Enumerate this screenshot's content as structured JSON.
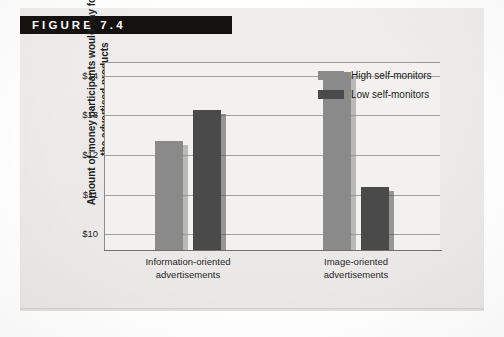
{
  "figure": {
    "header_label": "FIGURE 7.4"
  },
  "chart_data": {
    "type": "bar",
    "title": "",
    "xlabel": "",
    "ylabel": "Amount of money participants would pay for the advertised products",
    "categories": [
      "Information-oriented advertisements",
      "Image-oriented advertisements"
    ],
    "category_lines": [
      [
        "Information-oriented",
        "advertisements"
      ],
      [
        "Image-oriented",
        "advertisements"
      ]
    ],
    "series": [
      {
        "name": "High self-monitors",
        "color": "#8a8a8a",
        "values": [
          12.35,
          14.1
        ]
      },
      {
        "name": "Low self-monitors",
        "color": "#4a4a4a",
        "values": [
          13.15,
          11.2
        ]
      }
    ],
    "ylim": [
      9.6,
      14.35
    ],
    "yticks": [
      10,
      11,
      12,
      13,
      14
    ],
    "ytick_labels": [
      "$10",
      "$11",
      "$12",
      "$13",
      "$14"
    ],
    "grid": true,
    "legend_position": "top-right"
  },
  "legend": {
    "items": [
      {
        "label": "High self-monitors",
        "color": "#8a8a8a"
      },
      {
        "label": "Low self-monitors",
        "color": "#4a4a4a"
      }
    ]
  }
}
